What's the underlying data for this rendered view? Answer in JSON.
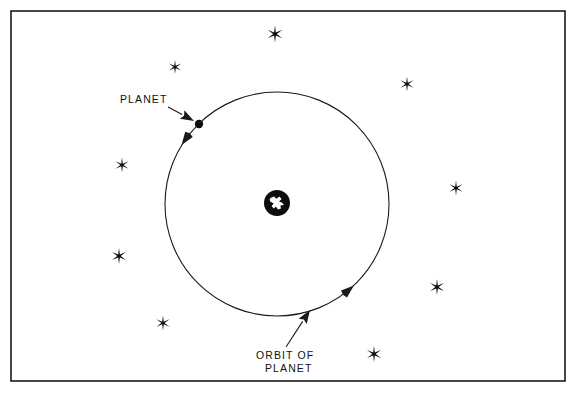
{
  "figure": {
    "kind": "astronomy-orbit-diagram",
    "background_color": "#ffffff",
    "ink_color": "#1a1a1a",
    "width": 579,
    "height": 398
  },
  "frame": {
    "name": "diagram-border",
    "x": 11,
    "y": 11,
    "width": 554,
    "height": 370,
    "stroke": "#1a1a1a"
  },
  "labels": {
    "planet": {
      "text": "PLANET",
      "x": 120,
      "y": 103
    },
    "orbit_line1": {
      "text": "ORBIT OF",
      "x": 256,
      "y": 359
    },
    "orbit_line2": {
      "text": "PLANET",
      "x": 265,
      "y": 372
    }
  },
  "orbit": {
    "name": "orbit-circle",
    "center_x": 277,
    "center_y": 204,
    "radius": 112,
    "direction": "counterclockwise",
    "arrowheads": [
      {
        "name": "orbit-arrowhead-top-left",
        "angle_deg": 215
      },
      {
        "name": "orbit-arrowhead-bottom-right",
        "angle_deg": 50
      }
    ]
  },
  "central_body": {
    "name": "central-globe",
    "center_x": 277,
    "center_y": 203,
    "radius": 13,
    "disc_color": "#0d0d0d",
    "land_color": "#ffffff"
  },
  "planet_marker": {
    "name": "planet-dot",
    "center_x": 199,
    "center_y": 124,
    "radius": 4.2,
    "color": "#0d0d0d"
  },
  "leaders": [
    {
      "name": "planet-leader",
      "from_x": 168,
      "from_y": 107,
      "to_x": 194,
      "to_y": 121
    },
    {
      "name": "orbit-leader",
      "from_x": 286,
      "from_y": 347,
      "to_x": 310,
      "to_y": 310
    }
  ],
  "stars": [
    {
      "name": "star-top-center",
      "x": 275,
      "y": 34,
      "size": 17
    },
    {
      "name": "star-upper-left",
      "x": 175,
      "y": 67,
      "size": 14
    },
    {
      "name": "star-upper-right",
      "x": 407,
      "y": 84,
      "size": 15
    },
    {
      "name": "star-left-upper",
      "x": 122,
      "y": 165,
      "size": 15
    },
    {
      "name": "star-right-mid",
      "x": 456,
      "y": 188,
      "size": 15
    },
    {
      "name": "star-left-lower",
      "x": 119,
      "y": 256,
      "size": 16
    },
    {
      "name": "star-right-lower",
      "x": 437,
      "y": 287,
      "size": 16
    },
    {
      "name": "star-bottom-left",
      "x": 163,
      "y": 323,
      "size": 15
    },
    {
      "name": "star-bottom-right",
      "x": 374,
      "y": 354,
      "size": 16
    }
  ]
}
